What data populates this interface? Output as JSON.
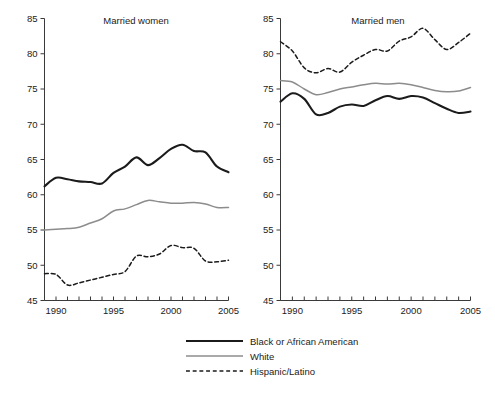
{
  "figure": {
    "background": "#ffffff",
    "axis_color": "#3a3a3a",
    "text_color": "#1b1b1b"
  },
  "legend": {
    "position": "bottom-center",
    "items": [
      {
        "label": "Black or African American",
        "color": "#1b1b1b",
        "style": "solid",
        "width": 2.2
      },
      {
        "label": "White",
        "color": "#8c8c8c",
        "style": "solid",
        "width": 1.6
      },
      {
        "label": "Hispanic/Latino",
        "color": "#1b1b1b",
        "style": "dashed",
        "width": 1.6
      }
    ]
  },
  "chart_data": [
    {
      "type": "line",
      "title": "Married women",
      "xlabel": "",
      "ylabel": "",
      "xlim": [
        1989,
        2005
      ],
      "ylim": [
        45,
        85
      ],
      "ytick_values": [
        45,
        50,
        55,
        60,
        65,
        70,
        75,
        80,
        85
      ],
      "ytick_labels": [
        "45",
        "50",
        "55",
        "60",
        "65",
        "70",
        "75",
        "80",
        "85"
      ],
      "xtick_values": [
        1990,
        1995,
        2000,
        2005
      ],
      "xtick_labels": [
        "1990",
        "1995",
        "2000",
        "2005"
      ],
      "xminor_ticks": [
        1989,
        1990,
        1991,
        1992,
        1993,
        1994,
        1995,
        1996,
        1997,
        1998,
        1999,
        2000,
        2001,
        2002,
        2003,
        2004,
        2005
      ],
      "grid": false,
      "x": [
        1989,
        1990,
        1991,
        1992,
        1993,
        1994,
        1995,
        1996,
        1997,
        1998,
        1999,
        2000,
        2001,
        2002,
        2003,
        2004,
        2005
      ],
      "series": [
        {
          "name": "Black or African American",
          "color": "#1b1b1b",
          "style": "solid",
          "values": [
            61.2,
            62.4,
            62.2,
            61.9,
            61.8,
            61.6,
            63.1,
            64.0,
            65.3,
            64.2,
            65.2,
            66.5,
            67.1,
            66.2,
            66.0,
            64.0,
            63.2,
            63.3,
            63.9
          ]
        },
        {
          "name": "White",
          "color": "#8c8c8c",
          "style": "solid",
          "values": [
            55.0,
            55.1,
            55.2,
            55.4,
            56.0,
            56.6,
            57.7,
            58.0,
            58.6,
            59.2,
            59.0,
            58.8,
            58.8,
            58.9,
            58.7,
            58.2,
            58.2
          ]
        },
        {
          "name": "Hispanic/Latino",
          "color": "#1b1b1b",
          "style": "dashed",
          "values": [
            48.8,
            48.7,
            47.2,
            47.5,
            47.9,
            48.3,
            48.7,
            49.1,
            51.3,
            51.2,
            51.6,
            52.8,
            52.5,
            52.4,
            50.6,
            50.5,
            50.7
          ]
        }
      ]
    },
    {
      "type": "line",
      "title": "Married men",
      "xlabel": "",
      "ylabel": "",
      "xlim": [
        1989,
        2005
      ],
      "ylim": [
        45,
        85
      ],
      "ytick_values": [
        45,
        50,
        55,
        60,
        65,
        70,
        75,
        80,
        85
      ],
      "ytick_labels": [
        "45",
        "50",
        "55",
        "60",
        "65",
        "70",
        "75",
        "80",
        "85"
      ],
      "xtick_values": [
        1990,
        1995,
        2000,
        2005
      ],
      "xtick_labels": [
        "1990",
        "1995",
        "2000",
        "2005"
      ],
      "xminor_ticks": [
        1989,
        1990,
        1991,
        1992,
        1993,
        1994,
        1995,
        1996,
        1997,
        1998,
        1999,
        2000,
        2001,
        2002,
        2003,
        2004,
        2005
      ],
      "grid": false,
      "x": [
        1989,
        1990,
        1991,
        1992,
        1993,
        1994,
        1995,
        1996,
        1997,
        1998,
        1999,
        2000,
        2001,
        2002,
        2003,
        2004,
        2005
      ],
      "series": [
        {
          "name": "Black or African American",
          "color": "#1b1b1b",
          "style": "solid",
          "values": [
            73.2,
            74.4,
            73.6,
            71.4,
            71.6,
            72.5,
            72.8,
            72.6,
            73.4,
            74.0,
            73.6,
            74.0,
            73.8,
            73.0,
            72.2,
            71.6,
            71.8
          ]
        },
        {
          "name": "White",
          "color": "#8c8c8c",
          "style": "solid",
          "values": [
            76.2,
            76.0,
            75.0,
            74.2,
            74.5,
            75.0,
            75.3,
            75.6,
            75.8,
            75.7,
            75.8,
            75.6,
            75.2,
            74.8,
            74.6,
            74.7,
            75.2
          ]
        },
        {
          "name": "Hispanic/Latino",
          "color": "#1b1b1b",
          "style": "dashed",
          "values": [
            81.7,
            80.4,
            78.0,
            77.3,
            77.9,
            77.4,
            78.8,
            79.8,
            80.6,
            80.4,
            81.8,
            82.4,
            83.6,
            82.0,
            80.6,
            81.6,
            82.9
          ]
        }
      ]
    }
  ]
}
